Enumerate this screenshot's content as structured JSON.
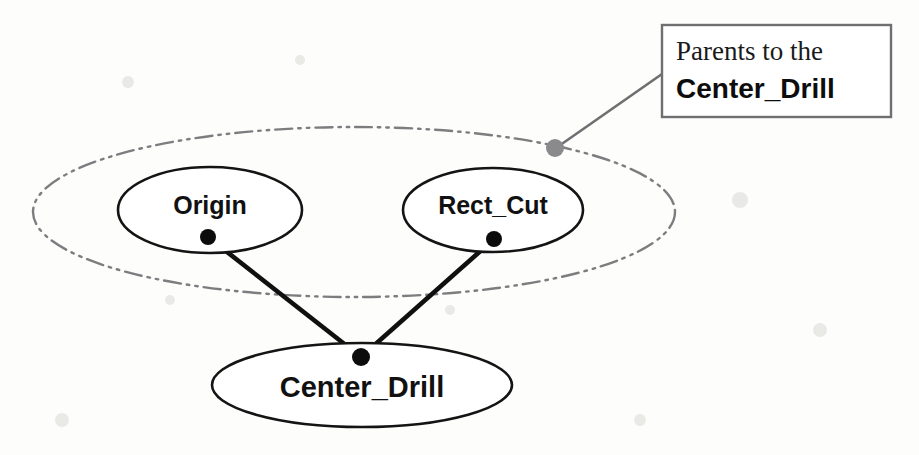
{
  "diagram": {
    "title": "Parents to the Center_Drill",
    "type": "feature-parent-child-graph",
    "nodes": [
      {
        "id": "origin",
        "label": "Origin",
        "role": "parent",
        "cx": 210,
        "cy": 210,
        "rx": 92,
        "ry": 43,
        "in_group": true
      },
      {
        "id": "rect_cut",
        "label": "Rect_Cut",
        "role": "parent",
        "cx": 493,
        "cy": 210,
        "rx": 90,
        "ry": 42,
        "in_group": true
      },
      {
        "id": "center_drill",
        "label": "Center_Drill",
        "role": "child",
        "cx": 362,
        "cy": 385,
        "rx": 150,
        "ry": 42,
        "in_group": false
      }
    ],
    "edges": [
      {
        "from": "origin",
        "to": "center_drill"
      },
      {
        "from": "rect_cut",
        "to": "center_drill"
      }
    ],
    "group_ellipse": {
      "name": "parents-group",
      "cx": 354,
      "cy": 212,
      "rx": 321,
      "ry": 85,
      "stroke_style": "dash-dot-dot",
      "color": "#7d7d80"
    },
    "connector_dots": [
      {
        "name": "origin-connector-dot",
        "cx": 208,
        "cy": 237,
        "r": 8
      },
      {
        "name": "rect-cut-connector-dot",
        "cx": 494,
        "cy": 239,
        "r": 8
      },
      {
        "name": "center-drill-junction-dot",
        "cx": 361,
        "cy": 357,
        "r": 9
      }
    ]
  },
  "callout": {
    "line1": "Parents to the",
    "line2": "Center_Drill",
    "box": {
      "x": 662,
      "y": 25,
      "width": 229,
      "height": 92
    },
    "leader": {
      "from_x": 556,
      "from_y": 148,
      "to_x": 662,
      "to_y": 74
    },
    "anchor_dot": {
      "cx": 555,
      "cy": 148,
      "r": 9
    },
    "border_color": "#6f6f72",
    "text_color": "#111111"
  },
  "colors": {
    "background": "#fdfdfc",
    "node_stroke": "#141414",
    "group_stroke": "#7d7d80",
    "edge": "#101010",
    "callout_accent": "#8a8a8d"
  }
}
